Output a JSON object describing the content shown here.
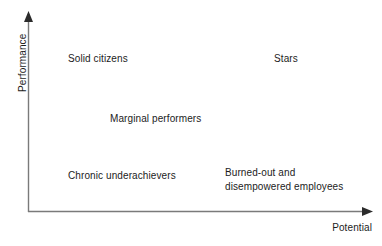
{
  "diagram": {
    "type": "two-by-two-matrix",
    "background_color": "#ffffff",
    "line_color": "#7a7a7a",
    "text_color": "#1c1c1c",
    "axes": {
      "y_axis_label": "Performance",
      "x_axis_label": "Potential",
      "y_axis_arrow": "up-arrow",
      "x_axis_arrow": "right-arrow"
    },
    "labels": {
      "top_left": "Solid citizens",
      "top_right": "Stars",
      "middle": "Marginal performers",
      "bottom_left": "Chronic underachievers",
      "bottom_right_line1": "Burned-out and",
      "bottom_right_line2": "disempowered employees"
    }
  }
}
